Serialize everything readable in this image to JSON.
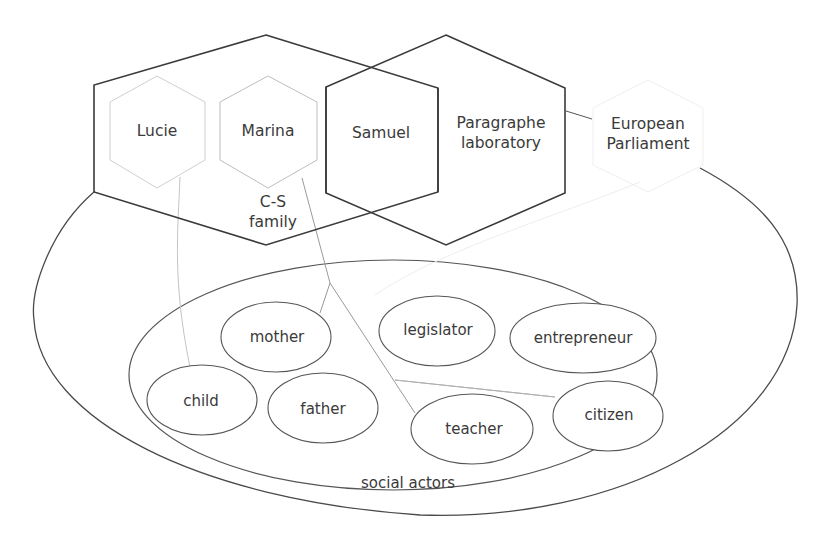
{
  "colors": {
    "background": "#ffffff",
    "strong_stroke": "#3c3c3c",
    "medium_stroke": "#5a5a5a",
    "light_stroke": "#c8c8c8",
    "faint_stroke": "#ececec",
    "text": "#3a3a3a"
  },
  "groups": [
    {
      "id": "cs-family",
      "label_line1": "C-S",
      "label_line2": "family",
      "shape": "hexagon",
      "style": "strong"
    },
    {
      "id": "paragraphe-laboratory",
      "label_line1": "Paragraphe",
      "label_line2": "laboratory",
      "shape": "hexagon",
      "style": "strong"
    },
    {
      "id": "social-actors",
      "label": "social actors",
      "shape": "ellipse",
      "style": "medium"
    }
  ],
  "individuals": [
    {
      "id": "lucie",
      "label": "Lucie",
      "shape": "hexagon",
      "style": "light"
    },
    {
      "id": "marina",
      "label": "Marina",
      "shape": "hexagon",
      "style": "light"
    },
    {
      "id": "samuel",
      "label": "Samuel",
      "shape": "hexagon",
      "style": "strong"
    },
    {
      "id": "european-parliament",
      "label_line1": "European",
      "label_line2": "Parliament",
      "shape": "hexagon",
      "style": "faint"
    }
  ],
  "roles": [
    {
      "id": "mother",
      "label": "mother"
    },
    {
      "id": "legislator",
      "label": "legislator"
    },
    {
      "id": "entrepreneur",
      "label": "entrepreneur"
    },
    {
      "id": "child",
      "label": "child"
    },
    {
      "id": "father",
      "label": "father"
    },
    {
      "id": "teacher",
      "label": "teacher"
    },
    {
      "id": "citizen",
      "label": "citizen"
    }
  ],
  "connections": [
    {
      "from": "lucie",
      "to": "child"
    },
    {
      "from": "marina",
      "to": "mother"
    },
    {
      "from": "marina",
      "to": "teacher"
    },
    {
      "from": "marina",
      "to": "citizen"
    },
    {
      "from": "paragraphe-laboratory",
      "to": "european-parliament"
    },
    {
      "from": "european-parliament",
      "to": "legislator"
    }
  ]
}
